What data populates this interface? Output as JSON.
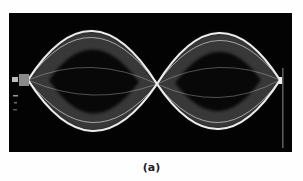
{
  "figure": {
    "caption": "(a)",
    "background_color": "#030303",
    "wave_color": "#e8e8e8",
    "loops": 2,
    "nodes": 3
  }
}
